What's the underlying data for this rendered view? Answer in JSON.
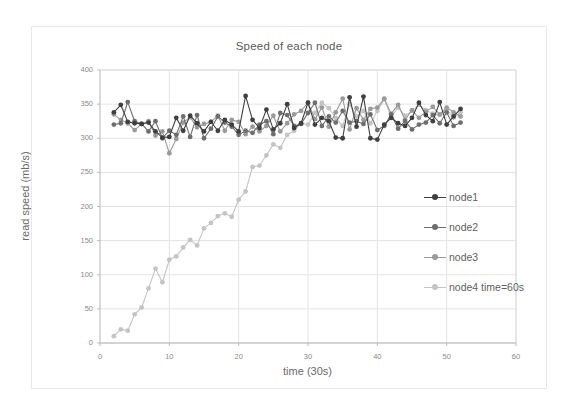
{
  "chart_data": {
    "type": "line",
    "title": "Speed of each node",
    "xlabel": "time (30s)",
    "ylabel": "read speed (mb/s)",
    "xlim": [
      0,
      60
    ],
    "ylim": [
      0,
      400
    ],
    "xticks": [
      0,
      10,
      20,
      30,
      40,
      50,
      60
    ],
    "yticks": [
      0,
      50,
      100,
      150,
      200,
      250,
      300,
      350,
      400
    ],
    "grid": true,
    "legend_position": "right",
    "x": [
      2,
      3,
      4,
      5,
      6,
      7,
      8,
      9,
      10,
      11,
      12,
      13,
      14,
      15,
      16,
      17,
      18,
      19,
      20,
      21,
      22,
      23,
      24,
      25,
      26,
      27,
      28,
      29,
      30,
      31,
      32,
      33,
      34,
      35,
      36,
      37,
      38,
      39,
      40,
      41,
      42,
      43,
      44,
      45,
      46,
      47,
      48,
      49,
      50,
      51,
      52
    ],
    "series": [
      {
        "name": "node1",
        "color": "#3f3f3f",
        "values": [
          338,
          349,
          324,
          322,
          321,
          323,
          310,
          301,
          302,
          330,
          311,
          333,
          322,
          310,
          324,
          311,
          327,
          320,
          310,
          362,
          327,
          315,
          342,
          313,
          322,
          350,
          315,
          322,
          352,
          320,
          330,
          325,
          301,
          300,
          360,
          317,
          361,
          300,
          298,
          320,
          330,
          322,
          318,
          330,
          352,
          334,
          325,
          353,
          320,
          332,
          343
        ]
      },
      {
        "name": "node2",
        "color": "#6e6e6e",
        "values": [
          320,
          322,
          353,
          325,
          321,
          310,
          325,
          300,
          311,
          305,
          332,
          302,
          334,
          300,
          314,
          332,
          323,
          317,
          305,
          311,
          308,
          320,
          325,
          306,
          337,
          334,
          318,
          321,
          337,
          352,
          318,
          332,
          323,
          340,
          323,
          325,
          321,
          335,
          312,
          318,
          335,
          314,
          325,
          313,
          320,
          323,
          334,
          322,
          338,
          318,
          323
        ]
      },
      {
        "name": "node3",
        "color": "#9a9a9a",
        "values": [
          335,
          327,
          322,
          312,
          321,
          325,
          304,
          310,
          278,
          299,
          323,
          331,
          316,
          321,
          324,
          333,
          311,
          327,
          324,
          306,
          317,
          310,
          318,
          333,
          310,
          322,
          335,
          340,
          352,
          328,
          345,
          317,
          338,
          358,
          313,
          344,
          327,
          343,
          345,
          358,
          336,
          349,
          327,
          341,
          330,
          339,
          346,
          335,
          345,
          338,
          332
        ]
      },
      {
        "name": "node4 time=60s",
        "color": "#c4c4c4",
        "values": [
          10,
          20,
          18,
          42,
          52,
          80,
          109,
          89,
          122,
          127,
          140,
          151,
          143,
          168,
          176,
          186,
          190,
          185,
          210,
          222,
          258,
          260,
          275,
          291,
          286,
          305,
          311,
          322,
          320,
          337,
          352,
          344,
          330,
          318,
          350,
          332,
          340,
          322,
          340,
          357,
          331,
          345,
          333,
          340,
          349,
          341,
          336,
          334,
          342,
          330,
          338
        ]
      }
    ]
  },
  "legend": {
    "items": [
      {
        "label": "node1"
      },
      {
        "label": "node2"
      },
      {
        "label": "node3"
      },
      {
        "label": "node4 time=60s"
      }
    ]
  }
}
